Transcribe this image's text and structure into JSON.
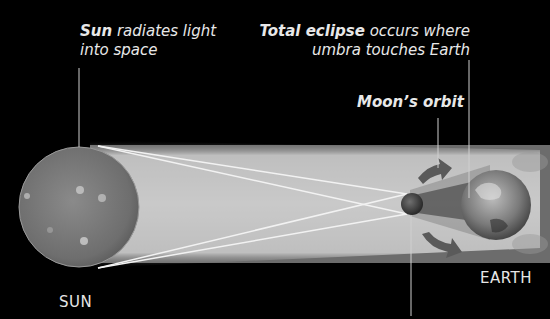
{
  "labels": {
    "sun_callout_bold": "Sun",
    "sun_callout_rest": " radiates light",
    "sun_callout_line2": "into space",
    "eclipse_callout_bold": "Total eclipse",
    "eclipse_callout_rest": " occurs where",
    "eclipse_callout_line2": "umbra touches Earth",
    "moon_orbit": "Moon’s orbit",
    "sun": "SUN",
    "earth": "EARTH"
  },
  "colors": {
    "background": "#000000",
    "beam": "#c8c8c8",
    "text": "#e8e8e8",
    "ray_lines": "#f2f2f2"
  }
}
